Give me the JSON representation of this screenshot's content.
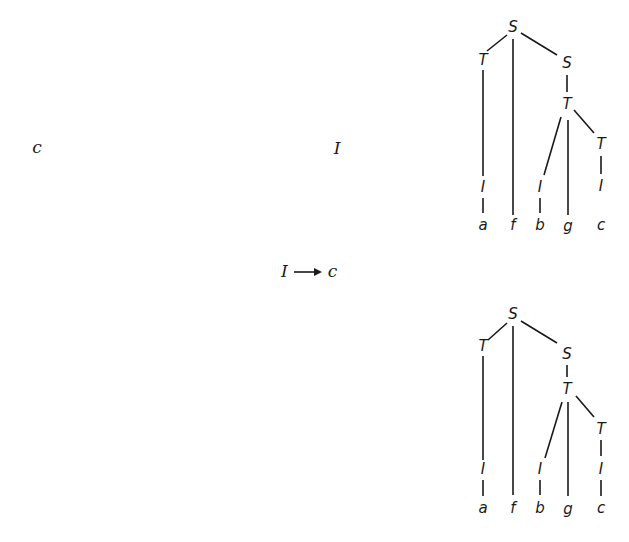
{
  "left_labels": {
    "terminal_symbol": "c",
    "nonterminal_symbol": "I"
  },
  "rule": {
    "lhs": "I",
    "arrow": "→",
    "rhs": "c"
  },
  "trees": [
    {
      "name": "parse-tree-before",
      "nodes": {
        "root_S": "S",
        "left_T": "T",
        "right_S": "S",
        "mid_T": "T",
        "right_T": "T",
        "I_a": "I",
        "I_b": "I",
        "I_c": "I"
      },
      "leaves": [
        "a",
        "f",
        "b",
        "g",
        "c"
      ],
      "c_connected": false
    },
    {
      "name": "parse-tree-after",
      "nodes": {
        "root_S": "S",
        "left_T": "T",
        "right_S": "S",
        "mid_T": "T",
        "right_T": "T",
        "I_a": "I",
        "I_b": "I",
        "I_c": "I"
      },
      "leaves": [
        "a",
        "f",
        "b",
        "g",
        "c"
      ],
      "c_connected": true
    }
  ]
}
